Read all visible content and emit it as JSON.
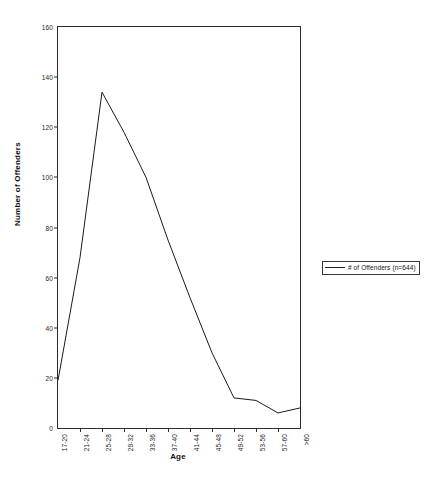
{
  "chart_data": {
    "type": "line",
    "title": "",
    "xlabel": "Age",
    "ylabel": "Number of Offenders",
    "categories": [
      "17-20",
      "21-24",
      "25-28",
      "29-32",
      "33-36",
      "37-40",
      "41-44",
      "45-48",
      "49-52",
      "53-56",
      "57-60",
      ">60"
    ],
    "series": [
      {
        "name": "# of Offenders (n=644)",
        "values": [
          19,
          68,
          134,
          118,
          100,
          75,
          52,
          30,
          12,
          11,
          6,
          8
        ],
        "color": "#1a1a1a"
      }
    ],
    "ylim": [
      0,
      160
    ],
    "yticks": [
      0,
      20,
      40,
      60,
      80,
      100,
      120,
      140,
      160
    ],
    "grid": false,
    "legend": {
      "position": "right",
      "entries": [
        "# of Offenders (n=644)"
      ]
    }
  }
}
